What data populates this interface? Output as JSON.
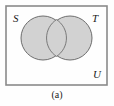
{
  "figure": {
    "caption": "(a)",
    "type": "venn-diagram",
    "labels": {
      "left_set": "S",
      "right_set": "T",
      "universe": "U"
    },
    "colors": {
      "background": "#fefefe",
      "circle_fill": "#d2d2d2",
      "circle_stroke": "#6e6e6e",
      "rect_stroke": "#8a8a8a",
      "text": "#1a1a1a"
    },
    "geometry": {
      "rect": {
        "x": 6,
        "y": 6,
        "width": 101,
        "height": 79
      },
      "left_circle": {
        "cx": 43,
        "cy": 38,
        "r": 22
      },
      "right_circle": {
        "cx": 70,
        "cy": 38,
        "r": 22
      }
    }
  }
}
